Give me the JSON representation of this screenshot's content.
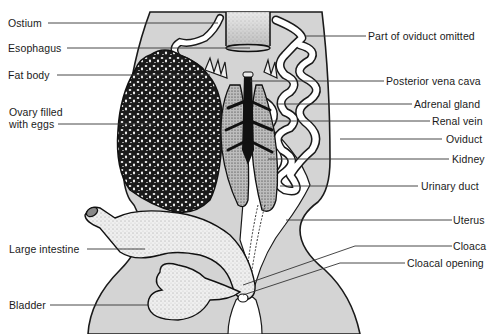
{
  "diagram": {
    "colors": {
      "background": "#ffffff",
      "body_fill": "#d4d4d4",
      "outline": "#1a1a1a",
      "leader_line": "#333333",
      "ovary_dark": "#1b1b1b",
      "organ_light": "#f1f1f1"
    },
    "labels_left": [
      {
        "id": "ostium",
        "text": "Ostium"
      },
      {
        "id": "esophagus",
        "text": "Esophagus"
      },
      {
        "id": "fat-body",
        "text": "Fat body"
      },
      {
        "id": "ovary",
        "line1": "Ovary filled",
        "line2": "with eggs"
      },
      {
        "id": "large-intestine",
        "text": "Large intestine"
      },
      {
        "id": "bladder",
        "text": "Bladder"
      }
    ],
    "labels_right": [
      {
        "id": "oviduct-omitted",
        "text": "Part of oviduct omitted"
      },
      {
        "id": "posterior-vena-cava",
        "text": "Posterior vena cava"
      },
      {
        "id": "adrenal-gland",
        "text": "Adrenal gland"
      },
      {
        "id": "renal-vein",
        "text": "Renal vein"
      },
      {
        "id": "oviduct",
        "text": "Oviduct"
      },
      {
        "id": "kidney",
        "text": "Kidney"
      },
      {
        "id": "urinary-duct",
        "text": "Urinary duct"
      },
      {
        "id": "uterus",
        "text": "Uterus"
      },
      {
        "id": "cloaca",
        "text": "Cloaca"
      },
      {
        "id": "cloacal-opening",
        "text": "Cloacal opening"
      }
    ]
  }
}
